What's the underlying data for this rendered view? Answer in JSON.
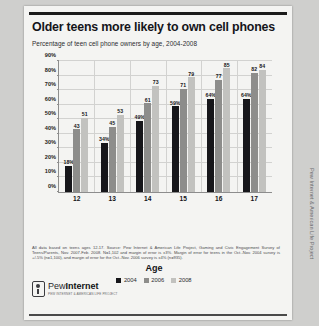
{
  "report": {
    "title": "Older teens more likely to own cell phones",
    "subtitle": "Percentage of teen cell phone owners by age, 2004-2008",
    "footnote": "All data based on teens ages 12-17. Source: Pew Internet & American Life Project, Gaming and Civic Engagement Survey of Teens/Parents, Nov. 2007-Feb. 2008. N=1,102 and margin of error is ±3%. Margin of error for teens in the Oct.-Nov. 2004 survey is +/-5% (n=1,100), and margin of error for the Oct.-Nov. 2006 survey is ±4% (n=935).",
    "logo_word_light": "Pew",
    "logo_word_bold": "Internet",
    "logo_tagline": "PEW INTERNET & AMERICAN LIFE PROJECT",
    "sidebar_vertical_text": "Pew Internet & American Life Project"
  },
  "chart_data": {
    "type": "bar",
    "title": "Older teens more likely to own cell phones",
    "subtitle": "Percentage of teen cell phone owners by age, 2004-2008",
    "xlabel": "Age",
    "ylabel": "",
    "ylim": [
      0,
      90
    ],
    "grid": true,
    "legend_position": "bottom",
    "categories": [
      "12",
      "13",
      "14",
      "15",
      "16",
      "17"
    ],
    "ytick_labels": [
      "0%",
      "10%",
      "20%",
      "30%",
      "40%",
      "50%",
      "60%",
      "70%",
      "80%",
      "90%"
    ],
    "ytick_values": [
      0,
      10,
      20,
      30,
      40,
      50,
      60,
      70,
      80,
      90
    ],
    "series": [
      {
        "name": "2004",
        "color": "#16161a",
        "values": [
          18,
          34,
          49,
          59,
          64,
          64
        ],
        "labels": [
          "18%",
          "34%",
          "49%",
          "59%",
          "64%",
          "64%"
        ]
      },
      {
        "name": "2006",
        "color": "#8d8d8b",
        "values": [
          43,
          45,
          61,
          71,
          77,
          82
        ],
        "labels": [
          "43",
          "45",
          "61",
          "71",
          "77",
          "82"
        ]
      },
      {
        "name": "2008",
        "color": "#c2c2bf",
        "values": [
          51,
          53,
          73,
          79,
          85,
          84
        ],
        "labels": [
          "51",
          "53",
          "73",
          "79",
          "85",
          "84"
        ]
      }
    ]
  }
}
